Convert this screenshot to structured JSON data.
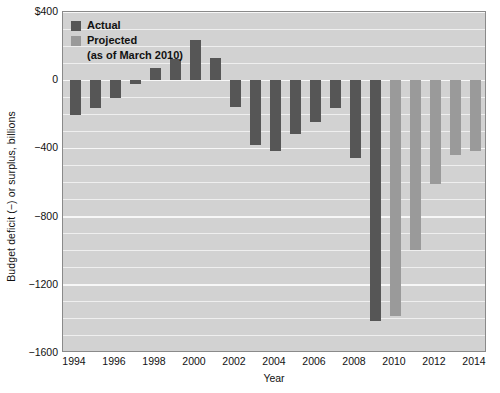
{
  "chart_data": {
    "type": "bar",
    "title": "",
    "xlabel": "Year",
    "ylabel": "Budget deficit (−) or surplus, billions",
    "ylim": [
      -1600,
      400
    ],
    "xlim": [
      1993.4,
      2014.6
    ],
    "grid": true,
    "ytick_labels": [
      "$400",
      "0",
      "−400",
      "−800",
      "−1200",
      "−1600"
    ],
    "ytick_values": [
      400,
      0,
      -400,
      -800,
      -1200,
      -1600
    ],
    "ygrid_values": [
      400,
      300,
      200,
      100,
      0,
      -100,
      -200,
      -300,
      -400,
      -500,
      -600,
      -700,
      -800,
      -900,
      -1000,
      -1100,
      -1200,
      -1300,
      -1400,
      -1500,
      -1600
    ],
    "xtick_labels": [
      "1994",
      "1996",
      "1998",
      "2000",
      "2002",
      "2004",
      "2006",
      "2008",
      "2010",
      "2012",
      "2014"
    ],
    "xtick_values": [
      1994,
      1996,
      1998,
      2000,
      2002,
      2004,
      2006,
      2008,
      2010,
      2012,
      2014
    ],
    "legend_position": "top-left",
    "colors": {
      "actual": "#565656",
      "projected": "#9a9a9a",
      "plot_background": "#d2d2d2",
      "gridline": "#f2f2f2",
      "frame": "#8a8a8a",
      "text": "#111111"
    },
    "series": [
      {
        "name": "Actual",
        "color": "#565656",
        "x": [
          1994,
          1995,
          1996,
          1997,
          1998,
          1999,
          2000,
          2001,
          2002,
          2003,
          2004,
          2005,
          2006,
          2007,
          2008,
          2009
        ],
        "values": [
          -203,
          -164,
          -107,
          -22,
          69,
          126,
          236,
          128,
          -158,
          -378,
          -413,
          -318,
          -248,
          -161,
          -459,
          -1413
        ]
      },
      {
        "name": "Projected (as of March 2010)",
        "color": "#9a9a9a",
        "x": [
          2010,
          2011,
          2012,
          2013,
          2014
        ],
        "values": [
          -1382,
          -996,
          -608,
          -438,
          -418
        ]
      }
    ],
    "legend": [
      {
        "label": "Actual",
        "color": "#565656"
      },
      {
        "label": "Projected",
        "color": "#9a9a9a",
        "sublabel": "(as of March 2010)"
      }
    ]
  }
}
